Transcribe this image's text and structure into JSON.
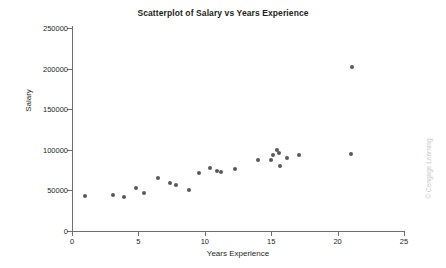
{
  "chart_data": {
    "type": "scatter",
    "title": "Scatterplot of Salary vs Years Experience",
    "xlabel": "Years Experience",
    "ylabel": "Salary",
    "xlim": [
      0,
      25
    ],
    "ylim": [
      0,
      250000
    ],
    "xticks": [
      0,
      5,
      10,
      15,
      20,
      25
    ],
    "yticks": [
      0,
      50000,
      100000,
      150000,
      200000,
      250000
    ],
    "xtick_labels": [
      "0",
      "5",
      "10",
      "15",
      "20",
      "25"
    ],
    "ytick_labels": [
      "0",
      "50000",
      "100000",
      "150000",
      "200000",
      "250000"
    ],
    "grid": false,
    "legend": false,
    "marker_color": "#58595b",
    "axis_color": "#6f6f6f",
    "series": [
      {
        "name": "Employees",
        "points": [
          [
            1.0,
            43000
          ],
          [
            3.1,
            44000
          ],
          [
            3.9,
            42000
          ],
          [
            4.8,
            53000
          ],
          [
            5.4,
            47000
          ],
          [
            6.5,
            65000
          ],
          [
            7.4,
            59000
          ],
          [
            7.8,
            57000
          ],
          [
            8.8,
            51000
          ],
          [
            9.6,
            72000
          ],
          [
            10.4,
            77000
          ],
          [
            10.9,
            74000
          ],
          [
            11.2,
            73000
          ],
          [
            12.3,
            76000
          ],
          [
            14.0,
            88000
          ],
          [
            15.0,
            88000
          ],
          [
            15.1,
            93000
          ],
          [
            15.4,
            100000
          ],
          [
            15.6,
            96000
          ],
          [
            15.7,
            80000
          ],
          [
            16.2,
            90000
          ],
          [
            17.1,
            94000
          ],
          [
            21.1,
            202000
          ],
          [
            21.0,
            95000
          ]
        ]
      }
    ]
  },
  "watermark": {
    "text": "© Cengage Learning"
  }
}
